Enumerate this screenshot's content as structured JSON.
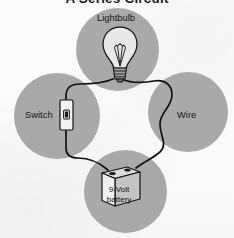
{
  "figure": {
    "title": "A Series Circuit",
    "type": "series-circuit-diagram",
    "background_color": "#fdfdfd",
    "lobe_color": "#a9a9a9",
    "wire_color": "#111111"
  },
  "labels": {
    "lightbulb": "Lightbulb",
    "switch": "Switch",
    "wire": "Wire",
    "battery_line1": "9-Volt",
    "battery_line2": "battery"
  },
  "components": [
    {
      "id": "lightbulb",
      "label": "Lightbulb",
      "position": "top",
      "icon": "lightbulb-icon"
    },
    {
      "id": "switch",
      "label": "Switch",
      "position": "left",
      "icon": "switch-icon"
    },
    {
      "id": "wire",
      "label": "Wire",
      "position": "right",
      "icon": "wire-icon"
    },
    {
      "id": "battery",
      "label": "9-Volt battery",
      "position": "bottom",
      "icon": "battery-icon"
    }
  ]
}
